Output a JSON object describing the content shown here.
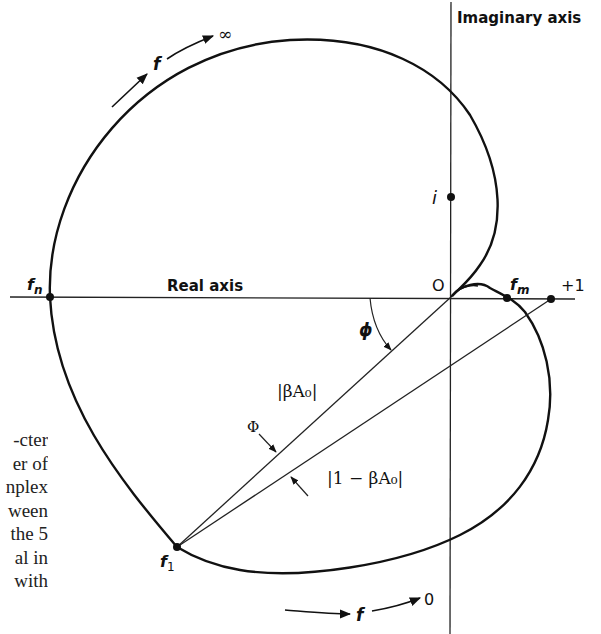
{
  "diagram": {
    "type": "Nyquist plot (complex plane)",
    "axes": {
      "imaginary_label": "Imaginary axis",
      "real_label": "Real axis",
      "origin_label": "O",
      "plus_one_label": "+1",
      "i_label": "i"
    },
    "points": {
      "f_n": {
        "base": "f",
        "sub": "n"
      },
      "f_m": {
        "base": "f",
        "sub": "m"
      },
      "f_1": {
        "base": "f",
        "sub": "1"
      }
    },
    "vectors": {
      "beta_a0": "|βA₀|",
      "one_minus_beta_a0": "|1 − βA₀|"
    },
    "angles": {
      "phi_small": "ϕ",
      "phi_large": "Φ"
    },
    "frequency_arrows": {
      "top": {
        "label": "f",
        "end": "∞"
      },
      "bottom": {
        "label": "f",
        "end": "0"
      }
    }
  },
  "page_text": {
    "lines": [
      "cter-",
      "er  of",
      "nplex",
      "ween",
      "5 the",
      "al  in",
      "with"
    ]
  }
}
